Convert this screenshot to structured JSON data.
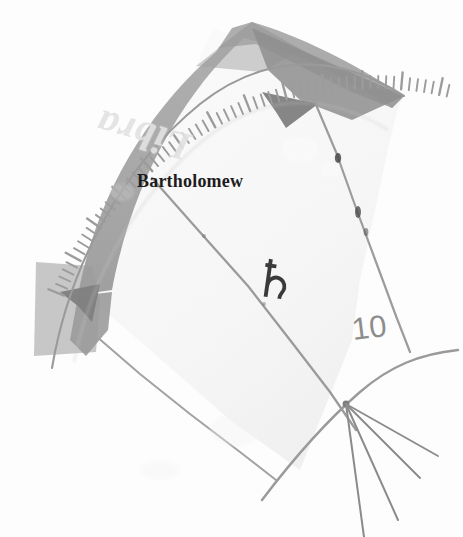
{
  "image": {
    "kind": "scanned-instrument-detail",
    "width": 463,
    "height": 537,
    "background_color": "#fdfdfd"
  },
  "band": {
    "name": "zodiac-band",
    "zodiac_sign_label": "Libra",
    "band_color": "#a8a8a8",
    "band_shadow_color": "#8e8e8e",
    "label_color": "#e2e2e2",
    "label_orientation": "inverted"
  },
  "annotations": {
    "maker_label": "Bartholomew",
    "maker_label_color": "#1d1d1d",
    "planet_glyph": "♄",
    "planet_glyph_name": "saturn-symbol",
    "planet_glyph_color": "#3a3a3a",
    "degree_label": "10",
    "degree_label_color": "#8d8d8d"
  },
  "scale": {
    "name": "graduated-arc",
    "tick_color": "#9c9c9c",
    "tick_count": 62,
    "rule_color": "#9a9a9a"
  },
  "pointers": [
    {
      "name": "upper-pointer",
      "color": "#8a8a8a"
    },
    {
      "name": "lower-pointer",
      "color": "#8a8a8a"
    }
  ],
  "rays": {
    "name": "ray-fan",
    "count": 4,
    "color": "#8b8b8b",
    "vertex_x": 346,
    "vertex_y": 404
  }
}
